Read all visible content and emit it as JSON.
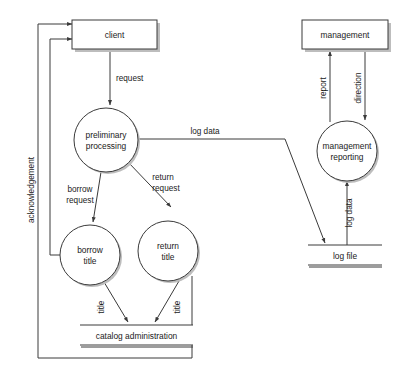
{
  "diagram": {
    "type": "data-flow-diagram",
    "colors": {
      "stroke": "#3a3a3a",
      "text": "#1a1a1a",
      "fill": "#ffffff",
      "shadow": "#bdbdbd"
    }
  },
  "externals": [
    {
      "id": "client",
      "label": "client"
    },
    {
      "id": "management",
      "label": "management"
    }
  ],
  "processes": [
    {
      "id": "preliminary-processing",
      "line1": "preliminary",
      "line2": "processing"
    },
    {
      "id": "borrow-title",
      "line1": "borrow",
      "line2": "title"
    },
    {
      "id": "return-title",
      "line1": "return",
      "line2": "title"
    },
    {
      "id": "management-reporting",
      "line1": "management",
      "line2": "reporting"
    }
  ],
  "datastores": [
    {
      "id": "catalog-administration",
      "label": "catalog administration"
    },
    {
      "id": "log-file",
      "label": "log file"
    }
  ],
  "flows": [
    {
      "id": "request",
      "label": "request",
      "from": "client",
      "to": "preliminary-processing"
    },
    {
      "id": "acknowledgement",
      "label": "acknowledgement",
      "from": "return-title",
      "to": "client"
    },
    {
      "id": "borrow-request",
      "label_line1": "borrow",
      "label_line2": "request",
      "from": "preliminary-processing",
      "to": "borrow-title"
    },
    {
      "id": "return-request",
      "label_line1": "return",
      "label_line2": "request",
      "from": "preliminary-processing",
      "to": "return-title"
    },
    {
      "id": "title-borrow",
      "label": "title",
      "from": "borrow-title",
      "to": "catalog-administration"
    },
    {
      "id": "title-return",
      "label": "title",
      "from": "return-title",
      "to": "catalog-administration"
    },
    {
      "id": "log-data-out",
      "label": "log data",
      "from": "preliminary-processing",
      "to": "log-file"
    },
    {
      "id": "log-data-in",
      "label": "log data",
      "from": "log-file",
      "to": "management-reporting"
    },
    {
      "id": "report",
      "label": "report",
      "from": "management-reporting",
      "to": "management"
    },
    {
      "id": "direction",
      "label": "direction",
      "from": "management",
      "to": "management-reporting"
    }
  ]
}
